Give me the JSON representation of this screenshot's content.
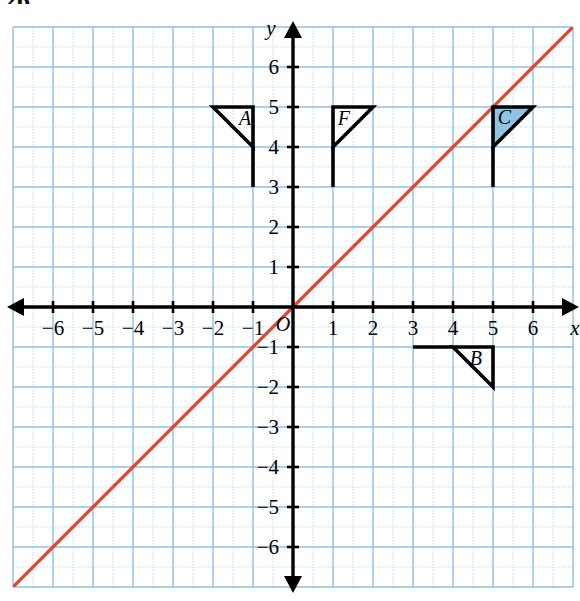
{
  "page": {
    "number": "26"
  },
  "chart_data": {
    "type": "scatter",
    "title": "",
    "xlabel": "x",
    "ylabel": "y",
    "xlim": [
      -7,
      7
    ],
    "ylim": [
      -7,
      7
    ],
    "grid": true,
    "grid_major_step": 1,
    "grid_minor_step": 0.5,
    "legend": "none",
    "origin_label": "O",
    "x_tick_labels": [
      "-6",
      "-5",
      "-4",
      "-3",
      "-2",
      "-1",
      "1",
      "2",
      "3",
      "4",
      "5",
      "6"
    ],
    "x_tick_values": [
      -6,
      -5,
      -4,
      -3,
      -2,
      -1,
      1,
      2,
      3,
      4,
      5,
      6
    ],
    "y_tick_labels": [
      "6",
      "5",
      "4",
      "3",
      "2",
      "1",
      "-1",
      "-2",
      "-3",
      "-4",
      "-5",
      "-6"
    ],
    "y_tick_values": [
      6,
      5,
      4,
      3,
      2,
      1,
      -1,
      -2,
      -3,
      -4,
      -5,
      -6
    ],
    "lines": [
      {
        "name": "line-y-equals-x",
        "equation": "y = x",
        "slope": 1,
        "intercept": 0,
        "color": "#e8402a",
        "from": [
          -7,
          -7
        ],
        "to": [
          7,
          7
        ]
      }
    ],
    "shapes": [
      {
        "label": "A",
        "name": "figure-a",
        "fill": "none",
        "stroke": "#000000",
        "triangle": [
          [
            -2,
            5
          ],
          [
            -1,
            5
          ],
          [
            -1,
            4
          ]
        ],
        "pole": [
          [
            -1,
            4
          ],
          [
            -1,
            3
          ]
        ],
        "label_position": [
          -1.35,
          4.55
        ]
      },
      {
        "label": "F",
        "name": "figure-f",
        "fill": "none",
        "stroke": "#000000",
        "triangle": [
          [
            1,
            5
          ],
          [
            2,
            5
          ],
          [
            1,
            4
          ]
        ],
        "pole": [
          [
            1,
            4
          ],
          [
            1,
            3
          ]
        ],
        "label_position": [
          1.12,
          4.55
        ]
      },
      {
        "label": "C",
        "name": "figure-c",
        "fill": "#8fc4e3",
        "stroke": "#000000",
        "triangle": [
          [
            5,
            5
          ],
          [
            6,
            5
          ],
          [
            5,
            4
          ]
        ],
        "pole": [
          [
            5,
            4
          ],
          [
            5,
            3
          ]
        ],
        "label_position": [
          5.12,
          4.58
        ]
      },
      {
        "label": "B",
        "name": "figure-b",
        "fill": "none",
        "stroke": "#000000",
        "triangle": [
          [
            4,
            -1
          ],
          [
            5,
            -1
          ],
          [
            5,
            -2
          ]
        ],
        "pole": [
          [
            3,
            -1
          ],
          [
            4,
            -1
          ]
        ],
        "label_position": [
          4.42,
          -1.45
        ]
      }
    ],
    "colors": {
      "grid_major": "#8fc0e0",
      "grid_minor": "#bcd9ee",
      "axis": "#000000",
      "line": "#e8402a",
      "shape_fill": "#8fc4e3"
    }
  }
}
